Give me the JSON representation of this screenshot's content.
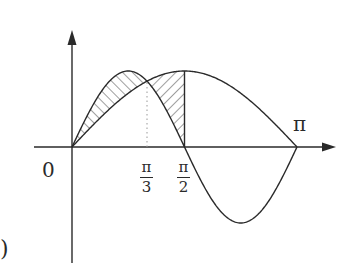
{
  "figure": {
    "colors": {
      "stroke": "#2a2a2a",
      "background": "#ffffff",
      "dotted": "#999999"
    },
    "labels": {
      "origin": "0",
      "pi": "π",
      "pi_over_3": {
        "num": "π",
        "den": "3"
      },
      "pi_over_2": {
        "num": "π",
        "den": "2"
      },
      "paren": ")"
    }
  },
  "chart_data": {
    "type": "line",
    "title": "",
    "xlabel": "",
    "ylabel": "",
    "xlim": [
      0,
      3.1416
    ],
    "ylim": [
      -1,
      1
    ],
    "grid": false,
    "x_ticks": [
      {
        "value": 0,
        "label": "0"
      },
      {
        "value": 1.0472,
        "label": "π/3"
      },
      {
        "value": 1.5708,
        "label": "π/2"
      },
      {
        "value": 3.1416,
        "label": "π"
      }
    ],
    "series": [
      {
        "name": "y = sin x",
        "function": "sin(x)",
        "x_range": [
          0,
          3.1416
        ],
        "max": {
          "x": 1.5708,
          "y": 1
        }
      },
      {
        "name": "y = sin 2x",
        "function": "sin(2x)",
        "x_range": [
          0,
          3.1416
        ],
        "max": {
          "x": 0.7854,
          "y": 1
        },
        "min": {
          "x": 2.3562,
          "y": -1
        }
      }
    ],
    "shaded_regions": [
      {
        "between": [
          "sin 2x",
          "sin x"
        ],
        "x_range": [
          0,
          1.0472
        ],
        "hatch": "backslash"
      },
      {
        "between": [
          "sin x",
          "sin 2x"
        ],
        "x_range": [
          1.0472,
          1.5708
        ],
        "hatch": "slash"
      }
    ],
    "annotations": [
      {
        "type": "dotted-vertical",
        "x": 1.0472,
        "from_y": 0,
        "to_y": 0.866
      },
      {
        "type": "solid-vertical",
        "x": 1.5708,
        "from_y": 0,
        "to_y": 1
      },
      {
        "type": "intersection",
        "x": 1.0472,
        "y": 0.866
      }
    ]
  }
}
